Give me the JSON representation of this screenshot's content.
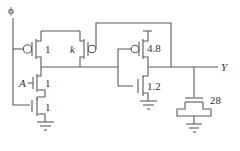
{
  "diagram": {
    "type": "cmos-dynamic-gate-schematic",
    "colors": {
      "wire": "#5a5a5a",
      "text": "#333333",
      "background": "#ffffff"
    },
    "labels": {
      "clock": "ϕ",
      "input_a": "A",
      "output": "Y",
      "precharge_pmos_size": "1",
      "keeper_size": "k",
      "inverter_pmos_size": "4.8",
      "inverter_nmos_size": "1.2",
      "input_nmos_size": "1",
      "foot_nmos_size": "1",
      "load_cap": "28"
    },
    "components": [
      {
        "id": "precharge-pmos",
        "type": "pmos",
        "gate": "ϕ",
        "size": "1"
      },
      {
        "id": "keeper-pmos",
        "type": "pmos",
        "gate": "Y",
        "size": "k"
      },
      {
        "id": "input-nmos",
        "type": "nmos",
        "gate": "A",
        "size": "1"
      },
      {
        "id": "foot-nmos",
        "type": "nmos",
        "gate": "ϕ",
        "size": "1"
      },
      {
        "id": "inverter-pmos",
        "type": "pmos",
        "size": "4.8"
      },
      {
        "id": "inverter-nmos",
        "type": "nmos",
        "size": "1.2"
      },
      {
        "id": "load-capacitor",
        "type": "mos-capacitor",
        "size": "28"
      }
    ]
  }
}
